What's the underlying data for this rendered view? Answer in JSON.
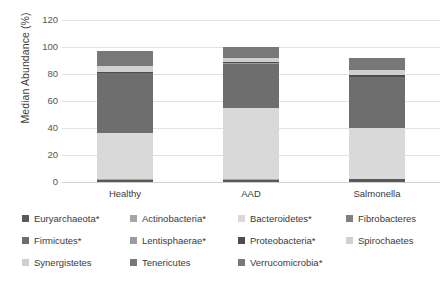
{
  "chart_data": {
    "type": "bar",
    "title": "",
    "subtitle": "",
    "stacked": true,
    "orientation": "vertical",
    "xlabel": "",
    "ylabel": "Median Abundance (%)",
    "categories": [
      "Healthy",
      "AAD",
      "Salmonella"
    ],
    "ylim": [
      0,
      120
    ],
    "yticks": [
      0,
      20,
      40,
      60,
      80,
      100,
      120
    ],
    "ytick_labels": [
      "0",
      "20",
      "40",
      "60",
      "80",
      "100",
      "120"
    ],
    "grid": true,
    "grid_axis": "y",
    "legend_position": "bottom",
    "legend_columns": 4,
    "series": [
      {
        "name": "Euryarchaeota*",
        "color": "#595959",
        "values": [
          1.5,
          1.5,
          2.0
        ]
      },
      {
        "name": "Actinobacteria*",
        "color": "#a6a6a6",
        "values": [
          0.4,
          0.4,
          0.4
        ]
      },
      {
        "name": "Bacteroidetes*",
        "color": "#d9d9d9",
        "values": [
          34.5,
          52.5,
          37.5
        ]
      },
      {
        "name": "Fibrobacteres",
        "color": "#7f7f7f",
        "values": [
          0.2,
          0.2,
          0.2
        ]
      },
      {
        "name": "Firmicutes*",
        "color": "#6e6e6e",
        "values": [
          44.0,
          33.0,
          37.5
        ]
      },
      {
        "name": "Lentisphaerae*",
        "color": "#9c9c9c",
        "values": [
          0.3,
          0.3,
          0.3
        ]
      },
      {
        "name": "Proteobacteria*",
        "color": "#4d4d4d",
        "values": [
          0.6,
          0.6,
          1.0
        ]
      },
      {
        "name": "Spirochaetes",
        "color": "#d0d0d0",
        "values": [
          3.8,
          3.0,
          4.0
        ]
      },
      {
        "name": "Synergistetes",
        "color": "#cfcfcf",
        "values": [
          0.3,
          0.3,
          0.3
        ]
      },
      {
        "name": "Tenericutes",
        "color": "#767676",
        "values": [
          0.6,
          0.6,
          0.6
        ]
      },
      {
        "name": "Verrucomicrobia*",
        "color": "#787878",
        "values": [
          10.8,
          7.6,
          8.2
        ]
      }
    ],
    "totals": [
      97.0,
      100.0,
      92.0
    ]
  },
  "axes": {
    "y_title": "Median Abundance (%)",
    "y_ticks": [
      {
        "label": "120",
        "value": 120
      },
      {
        "label": "100",
        "value": 100
      },
      {
        "label": "80",
        "value": 80
      },
      {
        "label": "60",
        "value": 60
      },
      {
        "label": "40",
        "value": 40
      },
      {
        "label": "20",
        "value": 20
      },
      {
        "label": "0",
        "value": 0
      }
    ],
    "x_ticks": [
      {
        "label": "Healthy"
      },
      {
        "label": "AAD"
      },
      {
        "label": "Salmonella"
      }
    ]
  },
  "legend": {
    "rows": [
      [
        {
          "label": "Euryarchaeota*",
          "color": "#595959"
        },
        {
          "label": "Actinobacteria*",
          "color": "#a6a6a6"
        },
        {
          "label": "Bacteroidetes*",
          "color": "#d9d9d9"
        },
        {
          "label": "Fibrobacteres",
          "color": "#7f7f7f"
        }
      ],
      [
        {
          "label": "Firmicutes*",
          "color": "#6e6e6e"
        },
        {
          "label": "Lentisphaerae*",
          "color": "#9c9c9c"
        },
        {
          "label": "Proteobacteria*",
          "color": "#4d4d4d"
        },
        {
          "label": "Spirochaetes",
          "color": "#d0d0d0"
        }
      ],
      [
        {
          "label": "Synergistetes",
          "color": "#cfcfcf"
        },
        {
          "label": "Tenericutes",
          "color": "#767676"
        },
        {
          "label": "Verrucomicrobia*",
          "color": "#787878"
        }
      ]
    ]
  },
  "style": {
    "background": "#ffffff",
    "gridline_color": "#e2e2e2",
    "text_color": "#3a3a3a"
  }
}
